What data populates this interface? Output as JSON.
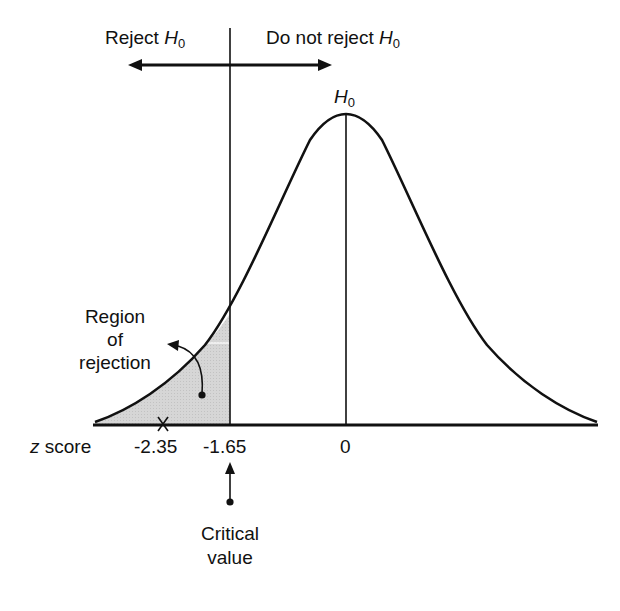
{
  "diagram": {
    "labels": {
      "reject_left": "Reject",
      "do_not_reject": "Do not reject",
      "hypothesis_symbol": "H",
      "hypothesis_subscript": "0",
      "region_line1": "Region",
      "region_line2": "of",
      "region_line3": "rejection",
      "axis_label_italic": "z",
      "axis_label_rest": " score",
      "critical_line1": "Critical",
      "critical_line2": "value"
    },
    "ticks": [
      {
        "value": -2.35,
        "label": "-2.35"
      },
      {
        "value": -1.65,
        "label": "-1.65"
      },
      {
        "value": 0,
        "label": "0"
      }
    ],
    "test_statistic": {
      "z": -2.35,
      "marker": "x-mark"
    },
    "critical_value": {
      "z": -1.65
    },
    "colors": {
      "line": "#111111",
      "shade": "#d4d4d4",
      "background": "#ffffff"
    }
  }
}
